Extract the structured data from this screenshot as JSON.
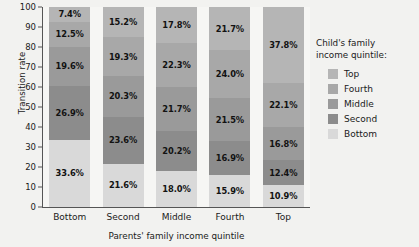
{
  "chart_data": {
    "type": "bar",
    "subtype": "stacked-percent",
    "title": "",
    "xlabel": "Parents' family income quintile",
    "ylabel": "Transition rate",
    "ylim": [
      0,
      100
    ],
    "yticks": [
      0,
      10,
      20,
      30,
      40,
      50,
      60,
      70,
      80,
      90,
      100
    ],
    "grid": false,
    "legend_position": "right",
    "legend_title": "Child's family income quintile:",
    "categories": [
      "Bottom",
      "Second",
      "Middle",
      "Fourth",
      "Top"
    ],
    "series": [
      {
        "name": "Top",
        "color": "#b5b5b5",
        "values": [
          7.4,
          15.2,
          17.8,
          21.7,
          37.8
        ],
        "labels": [
          "7.4%",
          "15.2%",
          "17.8%",
          "21.7%",
          "37.8%"
        ]
      },
      {
        "name": "Fourth",
        "color": "#a8a8a8",
        "values": [
          12.5,
          19.3,
          22.3,
          24.0,
          22.1
        ],
        "labels": [
          "12.5%",
          "19.3%",
          "22.3%",
          "24.0%",
          "22.1%"
        ]
      },
      {
        "name": "Middle",
        "color": "#9a9a9a",
        "values": [
          19.6,
          20.3,
          21.7,
          21.5,
          16.8
        ],
        "labels": [
          "19.6%",
          "20.3%",
          "21.7%",
          "21.5%",
          "16.8%"
        ]
      },
      {
        "name": "Second",
        "color": "#8c8c8c",
        "values": [
          26.9,
          23.6,
          20.2,
          16.9,
          12.4
        ],
        "labels": [
          "26.9%",
          "23.6%",
          "20.2%",
          "16.9%",
          "12.4%"
        ]
      },
      {
        "name": "Bottom",
        "color": "#d9d9d9",
        "values": [
          33.6,
          21.6,
          18.0,
          15.9,
          10.9
        ],
        "labels": [
          "33.6%",
          "21.6%",
          "18.0%",
          "15.9%",
          "10.9%"
        ]
      }
    ],
    "legend_entries": [
      {
        "label": "Top",
        "color": "#b5b5b5"
      },
      {
        "label": "Fourth",
        "color": "#a8a8a8"
      },
      {
        "label": "Middle",
        "color": "#9a9a9a"
      },
      {
        "label": "Second",
        "color": "#8c8c8c"
      },
      {
        "label": "Bottom",
        "color": "#d9d9d9"
      }
    ]
  }
}
